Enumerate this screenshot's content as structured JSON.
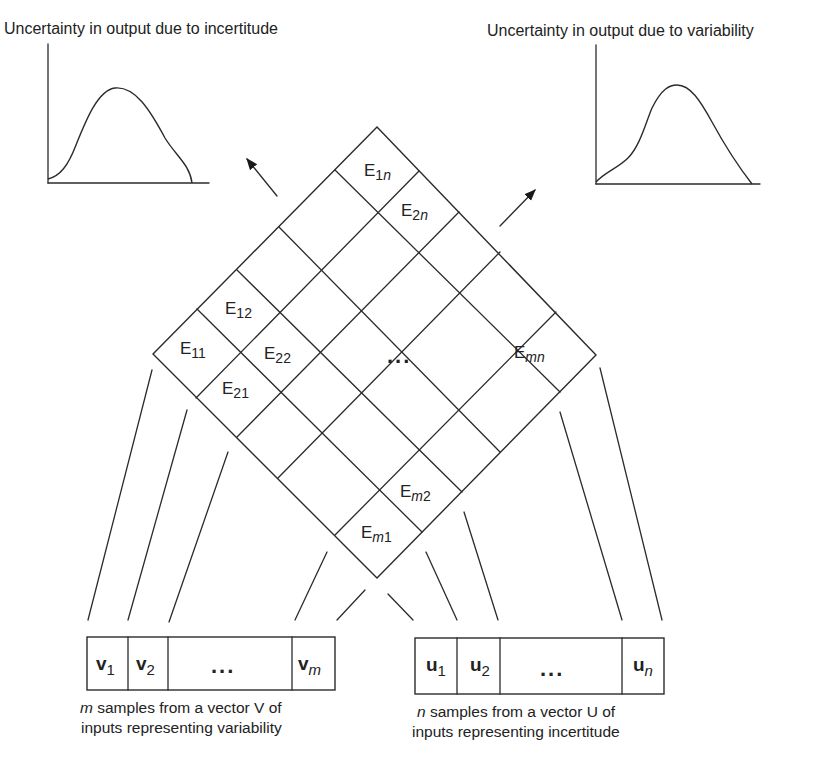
{
  "plots": {
    "incertitude": {
      "title": "Uncertainty in output due to incertitude"
    },
    "variability": {
      "title": "Uncertainty in output due to variability"
    }
  },
  "matrix": {
    "cells": {
      "e11": {
        "base": "E",
        "sub": "11"
      },
      "e12": {
        "base": "E",
        "sub": "12"
      },
      "e21": {
        "base": "E",
        "sub": "21"
      },
      "e22": {
        "base": "E",
        "sub": "22"
      },
      "e1n": {
        "base": "E",
        "sub": "1",
        "sub_italic": "n"
      },
      "e2n": {
        "base": "E",
        "sub": "2",
        "sub_italic": "n"
      },
      "em1": {
        "base": "E",
        "sub_italic": "m",
        "sub": "1"
      },
      "em2": {
        "base": "E",
        "sub_italic": "m",
        "sub": "2"
      },
      "emn": {
        "base": "E",
        "sub_italic": "mn"
      }
    },
    "ellipsis": "..."
  },
  "vector_v": {
    "cells": [
      {
        "base": "v",
        "sub": "1"
      },
      {
        "base": "v",
        "sub": "2"
      },
      {
        "ellipsis": "..."
      },
      {
        "base": "v",
        "sub_italic": "m"
      }
    ],
    "caption": {
      "line1_italic": "m",
      "line1_rest": " samples from a vector V of",
      "line2": "inputs representing variability"
    }
  },
  "vector_u": {
    "cells": [
      {
        "base": "u",
        "sub": "1"
      },
      {
        "base": "u",
        "sub": "2"
      },
      {
        "ellipsis": "..."
      },
      {
        "base": "u",
        "sub_italic": "n"
      }
    ],
    "caption": {
      "line1_italic": "n",
      "line1_rest": " samples from a vector U of",
      "line2": "inputs representing incertitude"
    }
  }
}
